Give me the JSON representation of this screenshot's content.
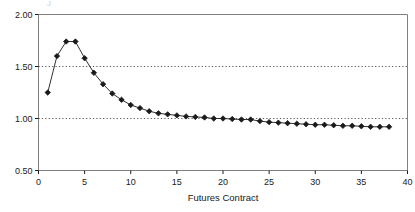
{
  "figure": {
    "background": "#ffffff",
    "frame_color": "#808080",
    "series_color": "#1a1a1a",
    "grid_color": "#555555",
    "top_fragment": "J"
  },
  "chart_data": {
    "type": "line",
    "title": "",
    "subtitle": "",
    "xlabel": "Futures Contract",
    "ylabel": "",
    "xlim": [
      0,
      40
    ],
    "ylim": [
      0.5,
      2.0
    ],
    "xticks": [
      0,
      5,
      10,
      15,
      20,
      25,
      30,
      35,
      40
    ],
    "xticklabels": [
      "0",
      "5",
      "10",
      "15",
      "20",
      "25",
      "30",
      "35",
      "40"
    ],
    "yticks": [
      0.5,
      1.0,
      1.5,
      2.0
    ],
    "yticklabels": [
      "0.50",
      "1.00",
      "1.50",
      "2.00"
    ],
    "gridlines_y": [
      1.0,
      1.5
    ],
    "grid": "dotted-horizontal",
    "legend": null,
    "marker": "filled-diamond",
    "series": [
      {
        "name": "Futures curve",
        "x": [
          1,
          2,
          3,
          4,
          5,
          6,
          7,
          8,
          9,
          10,
          11,
          12,
          13,
          14,
          15,
          16,
          17,
          18,
          19,
          20,
          21,
          22,
          23,
          24,
          25,
          26,
          27,
          28,
          29,
          30,
          31,
          32,
          33,
          34,
          35,
          36,
          37,
          38
        ],
        "values": [
          1.25,
          1.6,
          1.74,
          1.74,
          1.58,
          1.44,
          1.33,
          1.24,
          1.18,
          1.13,
          1.1,
          1.07,
          1.05,
          1.04,
          1.03,
          1.02,
          1.015,
          1.01,
          1.0,
          1.0,
          0.995,
          0.99,
          0.99,
          0.975,
          0.965,
          0.96,
          0.955,
          0.95,
          0.945,
          0.94,
          0.94,
          0.935,
          0.93,
          0.93,
          0.925,
          0.92,
          0.92,
          0.92
        ]
      }
    ]
  }
}
